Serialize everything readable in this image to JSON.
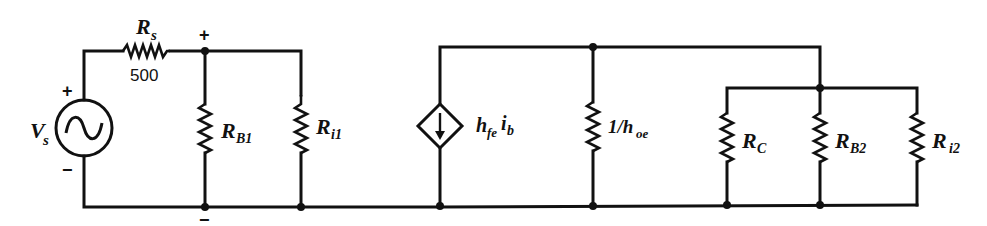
{
  "diagram": {
    "type": "small-signal equivalent circuit",
    "source": {
      "label": "V",
      "label_sub": "s",
      "plus": "+",
      "minus": "−",
      "kind": "ac-voltage-source"
    },
    "source_resistor": {
      "label": "R",
      "label_sub": "s",
      "value": "500"
    },
    "input_port": {
      "plus": "+",
      "minus": "−"
    },
    "resistors": [
      {
        "id": "RB1",
        "label": "R",
        "label_sub": "B1"
      },
      {
        "id": "Ri1",
        "label": "R",
        "label_sub": "i1"
      },
      {
        "id": "hoe",
        "label": "1/h",
        "label_sub": "oe"
      },
      {
        "id": "RC",
        "label": "R",
        "label_sub": "C"
      },
      {
        "id": "RB2",
        "label": "R",
        "label_sub": "B2"
      },
      {
        "id": "Ri2",
        "label": "R",
        "label_sub": "i2"
      }
    ],
    "dependent_source": {
      "kind": "current-controlled-current-source",
      "label_h": "h",
      "label_h_sub": "fe",
      "label_i": "i",
      "label_i_sub": "b",
      "direction": "down"
    }
  }
}
